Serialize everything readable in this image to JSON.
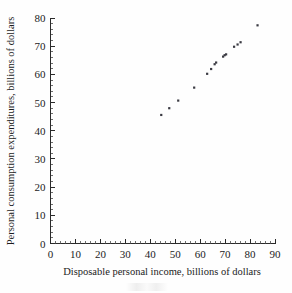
{
  "chart_data": {
    "type": "scatter",
    "title": "",
    "xlabel": "Disposable personal income, billions of dollars",
    "ylabel": "Personal consumption expenditures, billions of dollars",
    "xlim": [
      0,
      90
    ],
    "ylim": [
      0,
      80
    ],
    "xticks": [
      0,
      10,
      20,
      30,
      40,
      50,
      60,
      70,
      80,
      90
    ],
    "yticks": [
      0,
      10,
      20,
      30,
      40,
      50,
      60,
      70,
      80
    ],
    "xtick_labels": [
      "0",
      "10",
      "20",
      "30",
      "40",
      "50",
      "60",
      "70",
      "80",
      "90"
    ],
    "ytick_labels": [
      "0",
      "10",
      "20",
      "30",
      "40",
      "50",
      "60",
      "70",
      "80"
    ],
    "x_minor_tick_step": 2,
    "y_minor_tick_step": 2,
    "grid": false,
    "legend": false,
    "marker": "square",
    "marker_color": "#3a3a42",
    "marker_size": 2.2,
    "points": [
      {
        "x": 44.4,
        "y": 45.6
      },
      {
        "x": 47.6,
        "y": 48.0
      },
      {
        "x": 51.2,
        "y": 50.7
      },
      {
        "x": 57.6,
        "y": 55.3
      },
      {
        "x": 62.8,
        "y": 60.2
      },
      {
        "x": 64.4,
        "y": 61.9
      },
      {
        "x": 65.8,
        "y": 63.6
      },
      {
        "x": 66.4,
        "y": 64.2
      },
      {
        "x": 69.2,
        "y": 66.3
      },
      {
        "x": 69.8,
        "y": 66.8
      },
      {
        "x": 70.4,
        "y": 67.1
      },
      {
        "x": 73.6,
        "y": 69.8
      },
      {
        "x": 75.0,
        "y": 70.6
      },
      {
        "x": 76.2,
        "y": 71.4
      },
      {
        "x": 83.0,
        "y": 77.4
      }
    ],
    "x_values": [
      44.4,
      47.6,
      51.2,
      57.6,
      62.8,
      64.4,
      65.8,
      66.4,
      69.2,
      69.8,
      70.4,
      73.6,
      75.0,
      76.2,
      83.0
    ],
    "y_values": [
      45.6,
      48.0,
      50.7,
      55.3,
      60.2,
      61.9,
      63.6,
      64.2,
      66.3,
      66.8,
      67.1,
      69.8,
      70.6,
      71.4,
      77.4
    ]
  },
  "axes": {
    "x_axis_name": "x-axis",
    "y_axis_name": "y-axis"
  }
}
